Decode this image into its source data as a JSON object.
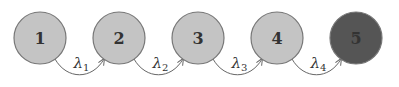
{
  "diagram": {
    "type": "markov-chain",
    "nodes": [
      {
        "id": "1",
        "label": "1",
        "fill": "#c4c4c4",
        "cx": 40
      },
      {
        "id": "2",
        "label": "2",
        "fill": "#c4c4c4",
        "cx": 119
      },
      {
        "id": "3",
        "label": "3",
        "fill": "#c4c4c4",
        "cx": 198
      },
      {
        "id": "4",
        "label": "4",
        "fill": "#c4c4c4",
        "cx": 277
      },
      {
        "id": "5",
        "label": "5",
        "fill": "#555555",
        "cx": 356
      }
    ],
    "edges": [
      {
        "from": "1",
        "to": "2",
        "symbol": "λ",
        "sub": "1"
      },
      {
        "from": "2",
        "to": "3",
        "symbol": "λ",
        "sub": "2"
      },
      {
        "from": "3",
        "to": "4",
        "symbol": "λ",
        "sub": "3"
      },
      {
        "from": "4",
        "to": "5",
        "symbol": "λ",
        "sub": "4"
      }
    ]
  }
}
